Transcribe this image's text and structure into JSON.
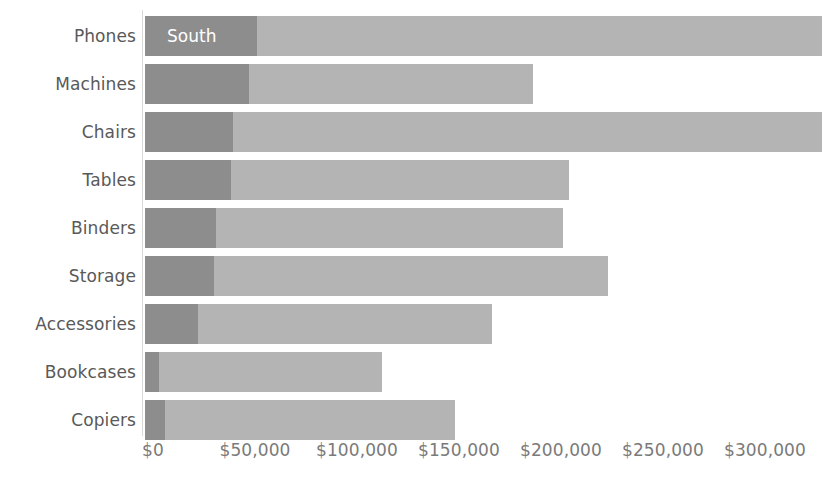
{
  "chart_data": {
    "type": "bar",
    "orientation": "horizontal",
    "stacked": true,
    "title": "",
    "xlabel": "",
    "ylabel": "",
    "xlim": [
      0,
      332000
    ],
    "axis_ticks": [
      "$0",
      "$50,000",
      "$100,000",
      "$150,000",
      "$200,000",
      "$250,000",
      "$300,000"
    ],
    "axis_tick_values": [
      0,
      50000,
      100000,
      150000,
      200000,
      250000,
      300000
    ],
    "grid": false,
    "legend_position": "in-bar-label",
    "annotations": [
      "South"
    ],
    "categories": [
      "Phones",
      "Machines",
      "Chairs",
      "Tables",
      "Binders",
      "Storage",
      "Accessories",
      "Bookcases",
      "Copiers"
    ],
    "series": [
      {
        "name": "South",
        "color": "#8d8d8d",
        "values": [
          55000,
          51000,
          43000,
          42000,
          35000,
          34000,
          26000,
          7000,
          10000
        ]
      },
      {
        "name": "Other",
        "color": "#b4b4b4",
        "values": [
          277000,
          139000,
          289000,
          166000,
          170000,
          193000,
          144000,
          109000,
          142000
        ]
      }
    ],
    "totals": [
      332000,
      190000,
      332000,
      208000,
      205000,
      227000,
      170000,
      116000,
      152000
    ]
  },
  "labels": {
    "inbar_series_label": "South"
  },
  "colors": {
    "south": "#8d8d8d",
    "other": "#b4b4b4",
    "text": "#595959",
    "tick_text": "#7a7a7a",
    "axis_line": "#d9d9d9",
    "background": "#ffffff"
  }
}
